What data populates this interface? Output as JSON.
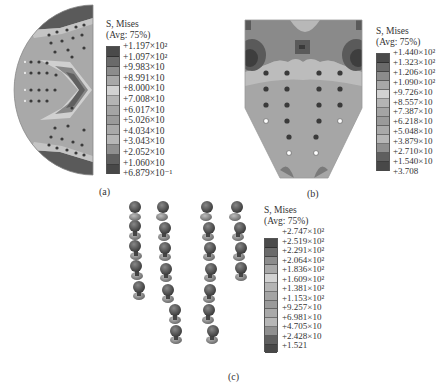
{
  "figure": {
    "panels": [
      {
        "id": "a",
        "caption": "(a)",
        "shape": "half-disc",
        "legend": {
          "title_line1": "S, Mises",
          "title_line2": "(Avg: 75%)",
          "values": [
            "+1.197×10²",
            "+1.097×10²",
            "+9.983×10",
            "+8.991×10",
            "+8.000×10",
            "+7.008×10",
            "+6.017×10",
            "+5.026×10",
            "+4.034×10",
            "+3.043×10",
            "+2.052×10",
            "+1.060×10",
            "+6.879×10⁻¹"
          ]
        }
      },
      {
        "id": "b",
        "caption": "(b)",
        "shape": "pentagon-plate",
        "legend": {
          "title_line1": "S, Mises",
          "title_line2": "(Avg: 75%)",
          "values": [
            "+1.440×10²",
            "+1.323×10²",
            "+1.206×10²",
            "+1.090×10²",
            "+9.726×10",
            "+8.557×10",
            "+7.387×10",
            "+6.218×10",
            "+5.048×10",
            "+3.879×10",
            "+2.710×10",
            "+1.540×10",
            "+3.708"
          ]
        }
      },
      {
        "id": "c",
        "caption": "(c)",
        "shape": "bolt-columns",
        "legend": {
          "title_line1": "S, Mises",
          "title_line2": "(Avg: 75%)",
          "values": [
            "+2.747×10²",
            "+2.519×10²",
            "+2.291×10²",
            "+2.064×10²",
            "+1.836×10²",
            "+1.609×10²",
            "+1.381×10²",
            "+1.153×10²",
            "+9.257×10",
            "+6.981×10",
            "+4.705×10",
            "+2.428×10",
            "+1.521"
          ]
        }
      }
    ],
    "legend_colors": [
      "#4a4a4a",
      "#6a6a6a",
      "#8c8c8c",
      "#a8a8a8",
      "#c9c9c9",
      "#b4b4b4",
      "#a4a4a4",
      "#9a9a9a",
      "#a9a9a9",
      "#b6b6b6",
      "#8f8f8f",
      "#5f5f5f",
      "#484848"
    ]
  }
}
